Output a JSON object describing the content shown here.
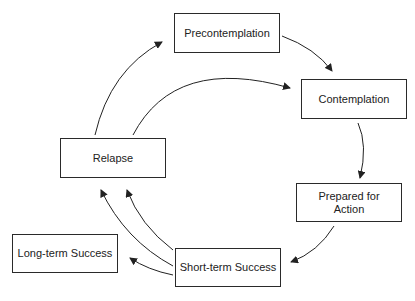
{
  "diagram": {
    "type": "cycle",
    "nodes": [
      {
        "id": "precontemplation",
        "label": "Precontemplation"
      },
      {
        "id": "contemplation",
        "label": "Contemplation"
      },
      {
        "id": "prepared",
        "label": "Prepared for\nAction",
        "line1": "Prepared for",
        "line2": "Action"
      },
      {
        "id": "short_term",
        "label": "Short-term Success"
      },
      {
        "id": "long_term",
        "label": "Long-term Success"
      },
      {
        "id": "relapse",
        "label": "Relapse"
      }
    ],
    "edges": [
      {
        "from": "precontemplation",
        "to": "contemplation"
      },
      {
        "from": "contemplation",
        "to": "prepared"
      },
      {
        "from": "prepared",
        "to": "short_term"
      },
      {
        "from": "short_term",
        "to": "long_term"
      },
      {
        "from": "short_term",
        "to": "relapse"
      },
      {
        "from": "short_term",
        "to": "relapse"
      },
      {
        "from": "relapse",
        "to": "precontemplation"
      },
      {
        "from": "relapse",
        "to": "contemplation"
      }
    ]
  }
}
